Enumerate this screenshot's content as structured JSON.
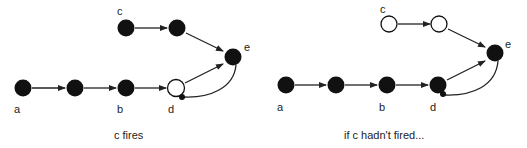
{
  "panels": [
    {
      "caption": "c fires",
      "labels": {
        "a": "a",
        "b": "b",
        "c": "c",
        "d": "d",
        "e": "e"
      },
      "node_states": {
        "a": "filled",
        "a2": "filled",
        "b": "filled",
        "d": "hollow",
        "c": "filled",
        "c2": "filled",
        "e": "filled"
      }
    },
    {
      "caption": "if c hadn't fired...",
      "labels": {
        "a": "a",
        "b": "b",
        "c": "c",
        "d": "d",
        "e": "e"
      },
      "node_states": {
        "a": "filled",
        "a2": "filled",
        "b": "filled",
        "d": "filled",
        "c": "hollow",
        "c2": "hollow",
        "e": "filled"
      }
    }
  ],
  "colors": {
    "node_fill": "#111111",
    "edge": "#222222",
    "background": "#ffffff"
  }
}
